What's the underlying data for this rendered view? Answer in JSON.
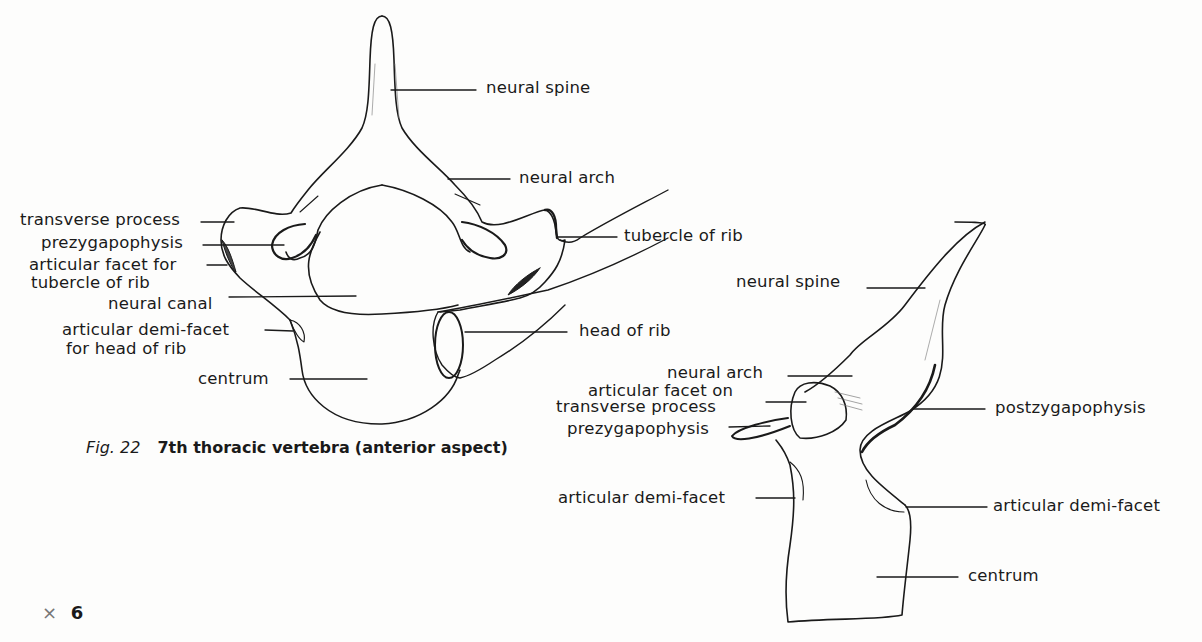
{
  "figure": {
    "number_label": "Fig. 22",
    "title": "7th thoracic vertebra",
    "aspect": "(anterior aspect)",
    "magnification_symbol": "×",
    "magnification_value": "6"
  },
  "anterior_view": {
    "labels": {
      "neural_spine": "neural spine",
      "neural_arch": "neural arch",
      "transverse_process": "transverse process",
      "prezygapophysis": "prezygapophysis",
      "articular_facet_line1": "articular facet for",
      "articular_facet_line2": "tubercle of rib",
      "neural_canal": "neural canal",
      "demi_facet_line1": "articular demi-facet",
      "demi_facet_line2": "for head of rib",
      "centrum": "centrum",
      "tubercle_of_rib": "tubercle of rib",
      "head_of_rib": "head of rib"
    }
  },
  "lateral_view": {
    "labels": {
      "neural_spine": "neural spine",
      "neural_arch": "neural arch",
      "facet_line1": "articular facet on",
      "facet_line2": "transverse process",
      "prezygapophysis": "prezygapophysis",
      "postzygapophysis": "postzygapophysis",
      "demi_facet_left": "articular demi-facet",
      "demi_facet_right": "articular demi-facet",
      "centrum": "centrum"
    }
  },
  "colors": {
    "ink": "#1a1a1a",
    "paper": "#fdfdfc",
    "faint_ink": "#777777"
  }
}
